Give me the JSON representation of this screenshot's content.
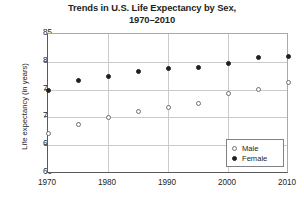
{
  "chart_data": {
    "type": "scatter",
    "title": "Trends in U.S. Life Expectancy by Sex, 1970–2010",
    "title_line1": "Trends in U.S. Life Expectancy by Sex,",
    "title_line2": "1970–2010",
    "xlabel": "",
    "ylabel": "Life expectancy (in years)",
    "xlim": [
      1970,
      2010
    ],
    "ylim": [
      60,
      85
    ],
    "xticks": [
      1970,
      1980,
      1990,
      2000,
      2010
    ],
    "yticks": [
      60,
      65,
      70,
      75,
      80,
      85
    ],
    "grid": true,
    "legend_position": "bottom-right",
    "x": [
      1970,
      1975,
      1980,
      1985,
      1990,
      1995,
      2000,
      2005,
      2010
    ],
    "series": [
      {
        "name": "Male",
        "marker": "open-circle",
        "color": "#6d6e71",
        "values": [
          67.1,
          68.8,
          70.0,
          71.1,
          71.8,
          72.5,
          74.3,
          75.0,
          76.2
        ]
      },
      {
        "name": "Female",
        "marker": "filled-circle",
        "color": "#231f20",
        "values": [
          74.8,
          76.6,
          77.4,
          78.2,
          78.8,
          78.9,
          79.7,
          80.7,
          81.0
        ]
      }
    ]
  },
  "legend": {
    "items": [
      {
        "label": "Male",
        "marker": "open-circle"
      },
      {
        "label": "Female",
        "marker": "filled-circle"
      }
    ]
  }
}
